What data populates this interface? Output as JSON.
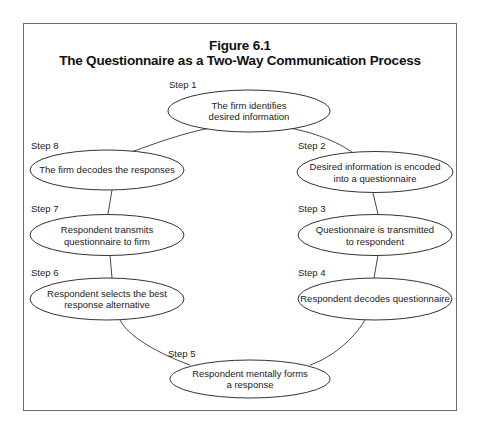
{
  "figure": {
    "number": "Figure 6.1",
    "title": "The Questionnaire as a Two-Way Communication Process"
  },
  "steps": [
    {
      "label": "Step 1",
      "text": "The firm identifies\ndesired information"
    },
    {
      "label": "Step 2",
      "text": "Desired information is encoded\ninto a questionnaire"
    },
    {
      "label": "Step 3",
      "text": "Questionnaire is transmitted\nto respondent"
    },
    {
      "label": "Step 4",
      "text": "Respondent decodes questionnaire"
    },
    {
      "label": "Step 5",
      "text": "Respondent mentally forms\na response"
    },
    {
      "label": "Step 6",
      "text": "Respondent selects the best\nresponse alternative"
    },
    {
      "label": "Step 7",
      "text": "Respondent transmits\nquestionnaire to firm"
    },
    {
      "label": "Step 8",
      "text": "The firm decodes the responses"
    }
  ],
  "colors": {
    "stroke": "#333333",
    "border": "#6b6b6b",
    "text": "#222222"
  }
}
